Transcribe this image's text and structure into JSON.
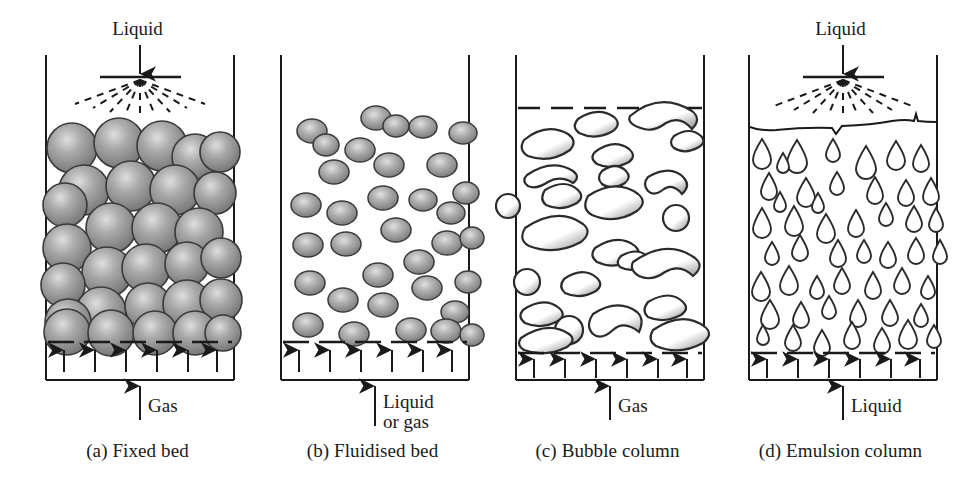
{
  "figure": {
    "type": "schematic-diagram",
    "panel_count": 4,
    "ink_color": "#1a1a1a",
    "particle_fill": "#8d8d8d",
    "particle_highlight": "#d8d8d8",
    "background": "#ffffff"
  },
  "panels": [
    {
      "id": "fixed-bed",
      "caption": "(a) Fixed bed",
      "top_label": "Liquid",
      "bottom_label": "Gas",
      "bottom_label_lines": [
        "Gas"
      ],
      "has_spray": true,
      "contents": "packed grey spheres",
      "particle_count": 30,
      "distributor": "dashed",
      "inlet_arrows": 6
    },
    {
      "id": "fluidised-bed",
      "caption": "(b) Fluidised bed",
      "top_label": "",
      "bottom_label": "Liquid or gas",
      "bottom_label_lines": [
        "Liquid",
        "or gas"
      ],
      "has_spray": false,
      "contents": "dispersed grey particles",
      "particle_count": 34,
      "distributor": "dashed",
      "inlet_arrows": 6
    },
    {
      "id": "bubble-column",
      "caption": "(c) Bubble column",
      "top_label": "",
      "bottom_label": "Gas",
      "bottom_label_lines": [
        "Gas"
      ],
      "has_spray": false,
      "contents": "white gas bubbles",
      "particle_count": 29,
      "distributor": "dashed",
      "level_line": "dashed",
      "inlet_arrows": 6
    },
    {
      "id": "emulsion-column",
      "caption": "(d) Emulsion column",
      "top_label": "Liquid",
      "bottom_label": "Liquid",
      "bottom_label_lines": [
        "Liquid"
      ],
      "has_spray": true,
      "contents": "liquid droplets",
      "particle_count": 57,
      "distributor": "dashed",
      "level_line": "wavy",
      "inlet_arrows": 6
    }
  ]
}
